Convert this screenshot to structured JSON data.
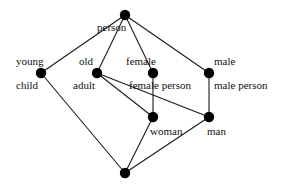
{
  "diagram": {
    "type": "concept-lattice",
    "colors": {
      "line": "#1a1a1a",
      "node": "#000000",
      "text": "#111111",
      "background": "#ffffff"
    },
    "nodes": [
      {
        "id": "top",
        "x": 125,
        "y": 15,
        "top_label": "",
        "bottom_label": "person"
      },
      {
        "id": "child",
        "x": 41,
        "y": 73,
        "top_label": "young",
        "bottom_label": "child"
      },
      {
        "id": "adult",
        "x": 97,
        "y": 73,
        "top_label": "old",
        "bottom_label": "adult"
      },
      {
        "id": "female",
        "x": 153,
        "y": 73,
        "top_label": "female",
        "bottom_label": "female person"
      },
      {
        "id": "male",
        "x": 209,
        "y": 73,
        "top_label": "male",
        "bottom_label": "male person"
      },
      {
        "id": "woman",
        "x": 153,
        "y": 117,
        "top_label": "",
        "bottom_label": "woman"
      },
      {
        "id": "man",
        "x": 209,
        "y": 117,
        "top_label": "",
        "bottom_label": "man"
      },
      {
        "id": "bottom",
        "x": 125,
        "y": 173,
        "top_label": "",
        "bottom_label": ""
      }
    ],
    "edges": [
      [
        "top",
        "child"
      ],
      [
        "top",
        "adult"
      ],
      [
        "top",
        "female"
      ],
      [
        "top",
        "male"
      ],
      [
        "child",
        "bottom"
      ],
      [
        "adult",
        "woman"
      ],
      [
        "adult",
        "man"
      ],
      [
        "female",
        "woman"
      ],
      [
        "male",
        "man"
      ],
      [
        "woman",
        "bottom"
      ],
      [
        "man",
        "bottom"
      ]
    ],
    "labels": {
      "person": "person",
      "young": "young",
      "child": "child",
      "old": "old",
      "adult": "adult",
      "female": "female",
      "female_person": "female person",
      "male": "male",
      "male_person": "male person",
      "woman": "woman",
      "man": "man"
    }
  }
}
